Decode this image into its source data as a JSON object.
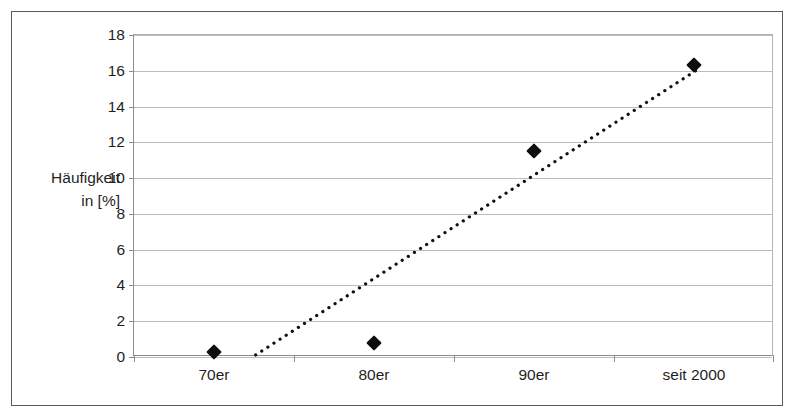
{
  "chart_data": {
    "type": "scatter",
    "title": "",
    "subtitle": "",
    "xlabel": "",
    "ylabel": "Häufigkeit in [%]",
    "ylabel_lines": [
      "Häufigkeit",
      "in [%]"
    ],
    "categories": [
      "70er",
      "80er",
      "90er",
      "seit 2000"
    ],
    "values": [
      0.3,
      0.8,
      11.5,
      16.3
    ],
    "series": [
      {
        "name": "Häufigkeit",
        "marker": "diamond",
        "color": "#0d0d0d",
        "values": [
          0.3,
          0.8,
          11.5,
          16.3
        ]
      }
    ],
    "ylim": [
      0,
      18
    ],
    "ytick_values": [
      0,
      2,
      4,
      6,
      8,
      10,
      12,
      14,
      16,
      18
    ],
    "ytick_labels": [
      "0",
      "2",
      "4",
      "6",
      "8",
      "10",
      "12",
      "14",
      "16",
      "18"
    ],
    "xtick_labels": [
      "70er",
      "80er",
      "90er",
      "seit 2000"
    ],
    "grid": {
      "horizontal": true,
      "vertical": false,
      "color": "#bcbcbc"
    },
    "legend": {
      "visible": false,
      "position": "none"
    },
    "trendline": {
      "visible": true,
      "style": "dotted",
      "color": "#111111",
      "x_start_fraction": 0.1906,
      "y_start_value": 0.0,
      "x_end_fraction": 0.885,
      "y_end_value": 16.1
    },
    "frame": {
      "outer_border_color": "#5a5a5a",
      "plot_border_color": "#8d8d8d",
      "background": "#ffffff"
    }
  }
}
